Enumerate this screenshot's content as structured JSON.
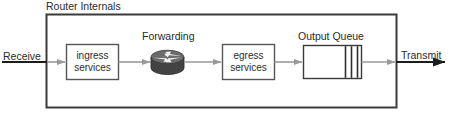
{
  "diagram": {
    "title": "Router Internals",
    "container_label": "Router Internals",
    "nodes": {
      "ingress": {
        "line1": "ingress",
        "line2": "services"
      },
      "forwarding": {
        "label": "Forwarding",
        "icon": "router-icon"
      },
      "egress": {
        "line1": "egress",
        "line2": "services"
      },
      "output_queue": {
        "label": "Output Queue",
        "queued_packets": 3
      }
    },
    "endpoints": {
      "receive": "Receive",
      "transmit": "Transmit"
    },
    "colors": {
      "stroke_dark": "#3a3a3a",
      "stroke_box": "#555555",
      "arrow_gray": "#9a9a9a",
      "router_body": "#4a4a4a",
      "router_top": "#6e6e6e",
      "text": "#2b2b2b",
      "background": "#ffffff"
    }
  }
}
